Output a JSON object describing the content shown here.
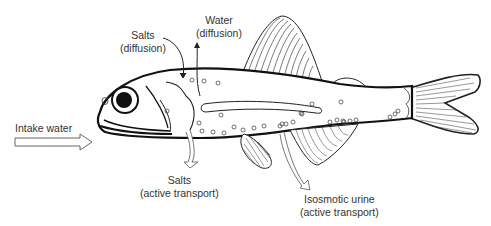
{
  "diagram": {
    "labels": {
      "intake_water": "Intake water",
      "salts_diffusion": {
        "line1": "Salts",
        "line2": "(diffusion)"
      },
      "water_diffusion": {
        "line1": "Water",
        "line2": "(diffusion)"
      },
      "salts_active": {
        "line1": "Salts",
        "line2": "(active transport)"
      },
      "urine": {
        "line1": "Isosmotic urine",
        "line2": "(active transport)"
      }
    },
    "arrows": [
      {
        "name": "intake-water-arrow",
        "direction": "into mouth"
      },
      {
        "name": "salts-diffusion-arrow",
        "direction": "into body at gills"
      },
      {
        "name": "water-diffusion-arrow",
        "direction": "out of body at gills"
      },
      {
        "name": "salts-active-arrow",
        "direction": "out of gills downward"
      },
      {
        "name": "urine-arrow",
        "direction": "out near anal fin"
      }
    ],
    "colors": {
      "line": "#1a1a1a",
      "text": "#333333",
      "background": "#ffffff"
    }
  }
}
